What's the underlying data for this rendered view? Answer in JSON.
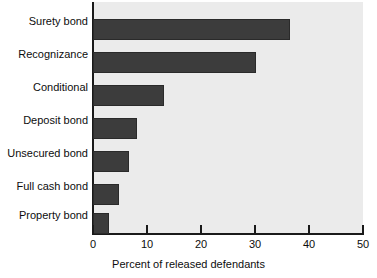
{
  "chart_data": {
    "type": "bar",
    "orientation": "horizontal",
    "title": "",
    "subtitle": "",
    "xlabel": "Percent of released defendants",
    "ylabel": "",
    "categories": [
      "Surety bond",
      "Recognizance",
      "Conditional",
      "Deposit bond",
      "Unsecured bond",
      "Full cash bond",
      "Property bond"
    ],
    "values": [
      36.5,
      30.2,
      13.1,
      8.1,
      6.7,
      4.8,
      3.0
    ],
    "xlim": [
      0,
      50
    ],
    "xticks": [
      0,
      10,
      20,
      30,
      40,
      50
    ],
    "xtick_labels": [
      "0",
      "10",
      "20",
      "30",
      "40",
      "50"
    ],
    "grid": false,
    "legend": false,
    "bar_color": "#3c3c3c",
    "plot_background": "#ebebeb",
    "axis_color": "#1a1a1a"
  }
}
